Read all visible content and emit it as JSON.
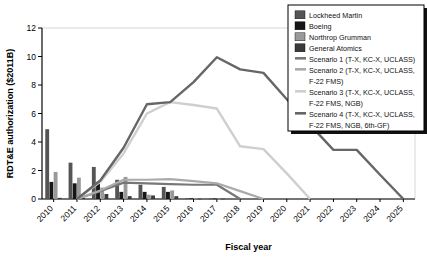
{
  "chart_data": {
    "type": "bar",
    "title": "",
    "xlabel": "Fiscal year",
    "ylabel": "RDT&E authorization ($2011B)",
    "categories": [
      "2010",
      "2011",
      "2012",
      "2013",
      "2014",
      "2015",
      "2016",
      "2017",
      "2018",
      "2019",
      "2020",
      "2021",
      "2022",
      "2023",
      "2024",
      "2025"
    ],
    "xlim": [
      2010,
      2025
    ],
    "ylim": [
      0,
      12
    ],
    "yticks": [
      0,
      2,
      4,
      6,
      8,
      10,
      12
    ],
    "grid": false,
    "legend_position": "top-right",
    "bar_series": [
      {
        "name": "Lockheed Martin",
        "color": "#555555",
        "values": [
          4.9,
          2.55,
          2.25,
          1.35,
          1.0,
          0.85,
          0.05,
          0.03,
          0,
          0,
          0,
          0,
          0,
          0,
          0,
          0
        ]
      },
      {
        "name": "Boeing",
        "color": "#161616",
        "values": [
          1.2,
          1.1,
          1.2,
          0.5,
          0.5,
          0.5,
          0.05,
          0.03,
          0,
          0,
          0,
          0,
          0,
          0,
          0,
          0
        ]
      },
      {
        "name": "Northrop Grumman",
        "color": "#999999",
        "values": [
          1.9,
          1.5,
          0.8,
          1.55,
          0.3,
          0.6,
          0.03,
          0.02,
          0,
          0,
          0,
          0,
          0,
          0,
          0,
          0
        ]
      },
      {
        "name": "General Atomics",
        "color": "#3a3a3a",
        "values": [
          0.08,
          0.07,
          0.35,
          0.2,
          0.25,
          0.2,
          0.02,
          0.02,
          0,
          0,
          0,
          0,
          0,
          0,
          0,
          0
        ]
      }
    ],
    "line_series": [
      {
        "name": "Scenario 1 (T-X, KC-X, UCLASS)",
        "color": "#777777",
        "width": 2.2,
        "x": [
          2011,
          2012,
          2013,
          2014,
          2015,
          2016,
          2017,
          2018
        ],
        "values": [
          0.0,
          0.55,
          1.15,
          1.1,
          1.05,
          1.0,
          1.0,
          0.0
        ]
      },
      {
        "name": "Scenario 2 (T-X, KC-X, UCLASS, F-22 FMS)",
        "color": "#aaaaaa",
        "width": 2.2,
        "x": [
          2011,
          2012,
          2013,
          2014,
          2015,
          2016,
          2017,
          2018,
          2019
        ],
        "values": [
          0.0,
          0.6,
          1.35,
          1.35,
          1.4,
          1.25,
          1.1,
          0.55,
          0.0
        ]
      },
      {
        "name": "Scenario 3 (T-X, KC-X, UCLASS, F-22 FMS, NGB)",
        "color": "#cfcfcf",
        "width": 2.4,
        "x": [
          2011,
          2012,
          2013,
          2014,
          2015,
          2016,
          2017,
          2018,
          2019,
          2020,
          2021
        ],
        "values": [
          0.0,
          1.2,
          3.2,
          6.0,
          6.8,
          6.6,
          6.35,
          3.7,
          3.5,
          1.8,
          0.0
        ]
      },
      {
        "name": "Scenario 4 (T-X, KC-X, UCLASS, F-22 FMS, NGB, 6th-GF)",
        "color": "#666666",
        "width": 2.4,
        "x": [
          2011,
          2012,
          2013,
          2014,
          2015,
          2016,
          2017,
          2018,
          2019,
          2020,
          2021,
          2022,
          2023,
          2024,
          2025
        ],
        "values": [
          0.0,
          1.3,
          3.6,
          6.65,
          6.8,
          8.2,
          9.95,
          9.1,
          8.85,
          7.0,
          5.2,
          3.45,
          3.45,
          1.7,
          0.0
        ]
      }
    ]
  },
  "legend": {
    "items": [
      {
        "label": "Lockheed Martin",
        "color": "#555555",
        "kind": "swatch"
      },
      {
        "label": "Boeing",
        "color": "#161616",
        "kind": "swatch"
      },
      {
        "label": "Northrop Grumman",
        "color": "#999999",
        "kind": "swatch"
      },
      {
        "label": "General Atomics",
        "color": "#3a3a3a",
        "kind": "swatch"
      },
      {
        "label": "Scenario 1 (T-X, KC-X, UCLASS)",
        "color": "#777777",
        "kind": "line"
      },
      {
        "label": "Scenario 2 (T-X, KC-X, UCLASS,",
        "label2": "F-22 FMS)",
        "color": "#aaaaaa",
        "kind": "line"
      },
      {
        "label": "Scenario 3 (T-X, KC-X, UCLASS,",
        "label2": "F-22 FMS, NGB)",
        "color": "#cfcfcf",
        "kind": "line"
      },
      {
        "label": "Scenario 4 (T-X, KC-X, UCLASS,",
        "label2": "F-22 FMS, NGB, 6th-GF)",
        "color": "#666666",
        "kind": "line"
      }
    ]
  },
  "axes": {
    "y_title": "RDT&E authorization ($2011B)",
    "x_title": "Fiscal year",
    "y_tick_labels": [
      "0",
      "2",
      "4",
      "6",
      "8",
      "10",
      "12"
    ],
    "x_tick_labels": [
      "2010",
      "2011",
      "2012",
      "2013",
      "2014",
      "2015",
      "2016",
      "2017",
      "2018",
      "2019",
      "2020",
      "2021",
      "2022",
      "2023",
      "2024",
      "2025"
    ]
  }
}
